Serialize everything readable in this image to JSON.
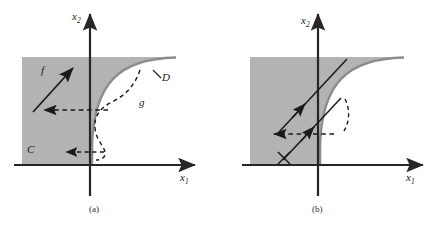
{
  "figure": {
    "type": "mathematical-diagram",
    "width": 442,
    "height": 227,
    "background_color": "#ffffff",
    "shaded_region_color": "#b3b3b3",
    "curve_color": "#8c8c8c",
    "axis_color": "#262626",
    "arrow_color": "#1a1a1a"
  },
  "panels": [
    {
      "caption": "(a)",
      "axis_x_label": "x",
      "axis_x_sub": "1",
      "axis_y_label": "x",
      "axis_y_sub": "2",
      "labels": [
        {
          "text": "f",
          "name": "vector-field-label-f"
        },
        {
          "text": "g",
          "name": "curve-label-g"
        },
        {
          "text": "C",
          "name": "region-label-c"
        },
        {
          "text": "D",
          "name": "region-label-d"
        }
      ]
    },
    {
      "caption": "(b)",
      "axis_x_label": "x",
      "axis_x_sub": "1",
      "axis_y_label": "x",
      "axis_y_sub": "2",
      "labels": []
    }
  ]
}
